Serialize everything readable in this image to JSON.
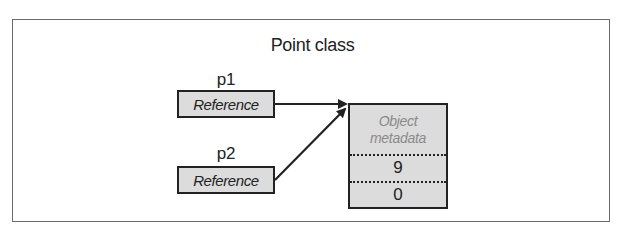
{
  "diagram": {
    "title": "Point class",
    "variables": [
      {
        "name": "p1",
        "box_label": "Reference"
      },
      {
        "name": "p2",
        "box_label": "Reference"
      }
    ],
    "object": {
      "metadata_line1": "Object",
      "metadata_line2": "metadata",
      "fields": [
        "9",
        "0"
      ]
    },
    "edges": [
      {
        "from": "p1",
        "to": "object"
      },
      {
        "from": "p2",
        "to": "object"
      }
    ],
    "colors": {
      "box_fill": "#dcdcdc",
      "border": "#222222",
      "frame": "#6b6b6b",
      "metadata_text": "#8a8a8a"
    }
  }
}
